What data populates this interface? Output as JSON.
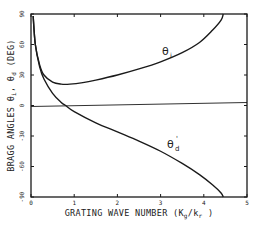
{
  "chart_data": {
    "type": "line",
    "title": "",
    "xlabel": "GRATING WAVE NUMBER (Kg/kr)",
    "xlabel_parts": {
      "main": "GRATING WAVE NUMBER (K",
      "sub1": "g",
      "mid": "/k",
      "sub2": "r",
      "end": " )"
    },
    "ylabel": "BRAGG ANGLES θi, θd (DEG)",
    "ylabel_parts": {
      "main": "BRAGG ANGLES θ",
      "sub1": "i",
      "mid": ", θ",
      "sub2": "d",
      "end": " (DEG)"
    },
    "xlim": [
      0,
      5
    ],
    "ylim": [
      -90,
      90
    ],
    "x_ticks": [
      "0",
      "1",
      "2",
      "3",
      "4",
      "5"
    ],
    "y_ticks": [
      "90",
      "60",
      "30",
      "0",
      "-30",
      "-60",
      "-90"
    ],
    "grid": false,
    "legend": "inline curve labels",
    "reference_line": {
      "y": 0,
      "label": "zero line"
    },
    "series": [
      {
        "name": "θi",
        "label_main": "θ",
        "label_sub": "i",
        "x": [
          0.05,
          0.1,
          0.2,
          0.3,
          0.5,
          0.7,
          0.9,
          1.2,
          1.5,
          2.0,
          2.5,
          3.0,
          3.5,
          3.9,
          4.2,
          4.4,
          4.45
        ],
        "y": [
          88,
          60,
          40,
          30,
          23,
          21,
          21,
          22.5,
          25,
          30,
          36,
          43,
          52,
          62,
          74,
          84,
          90
        ]
      },
      {
        "name": "θd",
        "label_main": "θ",
        "label_sub": "d",
        "x": [
          0.05,
          0.1,
          0.2,
          0.3,
          0.5,
          0.7,
          0.8,
          1.0,
          1.5,
          2.0,
          2.5,
          3.0,
          3.5,
          3.9,
          4.2,
          4.4,
          4.45
        ],
        "y": [
          88,
          60,
          38,
          26,
          12,
          3,
          0,
          -6,
          -17,
          -26,
          -35,
          -45,
          -57,
          -68,
          -78,
          -86,
          -90
        ]
      }
    ]
  }
}
